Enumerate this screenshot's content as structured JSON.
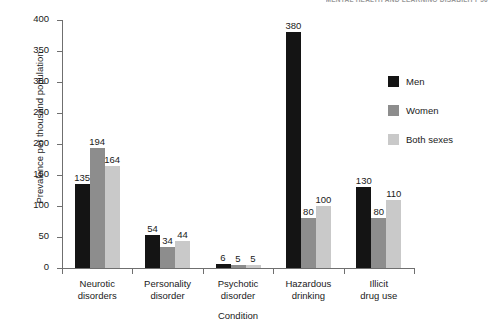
{
  "running_header": "MENTAL HEALTH AND LEARNING DISABILITY 56",
  "chart_data": {
    "type": "bar",
    "title": "",
    "xlabel": "Condition",
    "ylabel": "Prevalence per thousand population",
    "ylim": [
      0,
      400
    ],
    "yticks": [
      0,
      50,
      100,
      150,
      200,
      250,
      300,
      350,
      400
    ],
    "ytick_labels": [
      "0",
      "50",
      "100",
      "150",
      "200",
      "250",
      "300",
      "350",
      "400"
    ],
    "grid": false,
    "legend_position": "right",
    "categories": [
      "Neurotic\ndisorders",
      "Personality\ndisorder",
      "Psychotic\ndisorder",
      "Hazardous\ndrinking",
      "Illicit\ndrug use"
    ],
    "category_lines": [
      [
        "Neurotic",
        "disorders"
      ],
      [
        "Personality",
        "disorder"
      ],
      [
        "Psychotic",
        "disorder"
      ],
      [
        "Hazardous",
        "drinking"
      ],
      [
        "Illicit",
        "drug use"
      ]
    ],
    "series": [
      {
        "name": "Men",
        "color": "#141414",
        "values": [
          135,
          54,
          6,
          380,
          130
        ]
      },
      {
        "name": "Women",
        "color": "#8d8d8d",
        "values": [
          194,
          34,
          5,
          80,
          80
        ]
      },
      {
        "name": "Both sexes",
        "color": "#c9c9c9",
        "values": [
          164,
          44,
          5,
          100,
          110
        ]
      }
    ],
    "data_labels": [
      [
        "135",
        "194",
        "164"
      ],
      [
        "54",
        "34",
        "44"
      ],
      [
        "6",
        "5",
        "5"
      ],
      [
        "380",
        "80",
        "100"
      ],
      [
        "130",
        "80",
        "110"
      ]
    ]
  },
  "legend": {
    "items": [
      {
        "label": "Men",
        "color": "#141414"
      },
      {
        "label": "Women",
        "color": "#8d8d8d"
      },
      {
        "label": "Both sexes",
        "color": "#c9c9c9"
      }
    ]
  }
}
